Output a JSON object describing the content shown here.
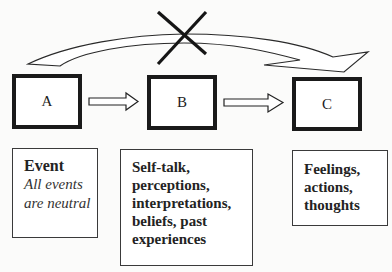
{
  "diagram": {
    "type": "ABC model flow diagram",
    "nodes": [
      {
        "id": "A",
        "label": "A"
      },
      {
        "id": "B",
        "label": "B"
      },
      {
        "id": "C",
        "label": "C"
      }
    ],
    "edges": [
      {
        "from": "A",
        "to": "B",
        "style": "hollow-arrow"
      },
      {
        "from": "B",
        "to": "C",
        "style": "hollow-arrow"
      },
      {
        "from": "A",
        "to": "C",
        "style": "curved-hollow-arrow",
        "crossed_out": true
      }
    ],
    "crossed_out_mark": "X",
    "descriptions": {
      "a": {
        "title": "Event",
        "subtitle_lines": [
          "All events",
          "are neutral"
        ]
      },
      "b": {
        "lines": [
          "Self-talk,",
          "perceptions,",
          "interpretations,",
          "beliefs, past",
          "experiences"
        ]
      },
      "c": {
        "lines": [
          "Feelings,",
          "actions,",
          "thoughts"
        ]
      }
    },
    "colors": {
      "stroke": "#1a1a1a",
      "background": "#fbfbfa",
      "text": "#1c1c1c"
    }
  }
}
